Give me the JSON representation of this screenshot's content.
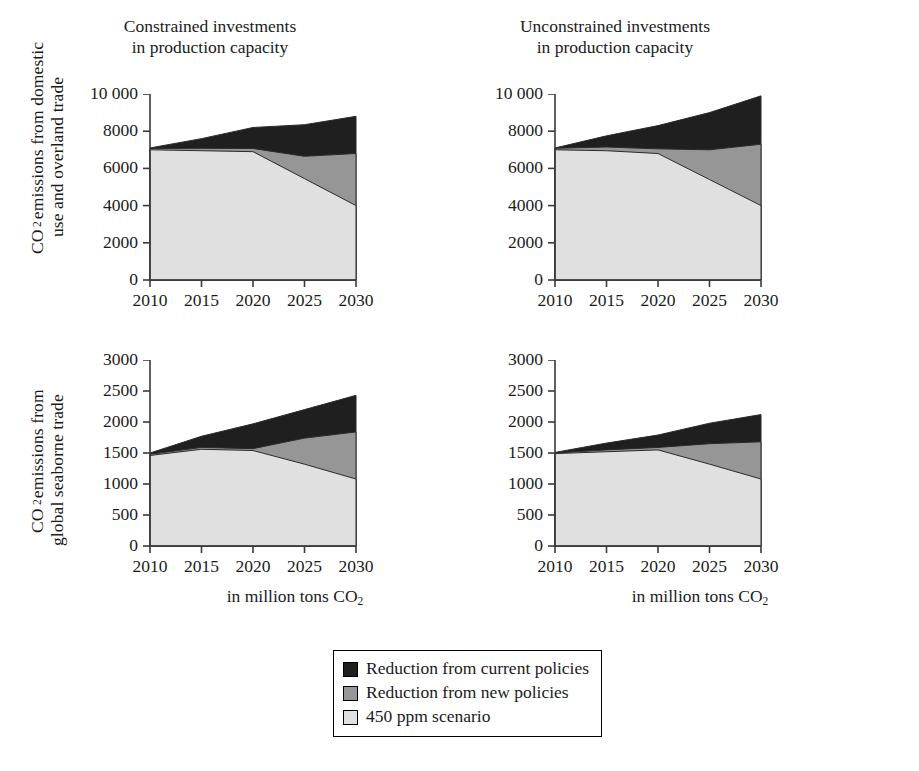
{
  "figure": {
    "row_captions": [
      "CO₂ emissions from domestic\nuse and overland trade",
      "CO₂ emissions from\nglobal seaborne trade"
    ],
    "x_caption": "in million tons CO₂"
  },
  "legend": {
    "items": [
      {
        "label": "Reduction from current policies",
        "color": "#1f1f1f"
      },
      {
        "label": "Reduction from new policies",
        "color": "#969696"
      },
      {
        "label": "450 ppm scenario",
        "color": "#e0e0e0"
      }
    ]
  },
  "colors": {
    "current_policies": "#1f1f1f",
    "new_policies": "#969696",
    "ppm450": "#e0e0e0",
    "axis": "#3a3a3a",
    "outline": "#2b2b2b",
    "text": "#1a1a1a",
    "background": "#ffffff"
  },
  "chart_data": [
    {
      "id": "top-left",
      "type": "area",
      "stacked": true,
      "title": "Constrained investments\nin production capacity",
      "xlabel": "in million tons CO₂",
      "ylabel": "CO₂ emissions from domestic use and overland trade",
      "x": [
        2010,
        2015,
        2020,
        2025,
        2030
      ],
      "xlim": [
        2010,
        2030
      ],
      "xticks": [
        2010,
        2015,
        2020,
        2025,
        2030
      ],
      "xticklabels": [
        "2010",
        "2015",
        "2020",
        "2025",
        "2030"
      ],
      "ylim": [
        0,
        10000
      ],
      "yticks": [
        0,
        2000,
        4000,
        6000,
        8000,
        10000
      ],
      "yticklabels": [
        "0",
        "2000",
        "4000",
        "6000",
        "8000",
        "10 000"
      ],
      "grid": false,
      "legend_position": "below-figure",
      "series": [
        {
          "name": "450 ppm scenario",
          "values": [
            7000,
            6950,
            6900,
            5450,
            4000
          ]
        },
        {
          "name": "Reduction from new policies",
          "values": [
            70,
            130,
            170,
            1200,
            2800
          ]
        },
        {
          "name": "Reduction from current policies",
          "values": [
            30,
            520,
            1130,
            1700,
            2000
          ]
        }
      ],
      "cumulative_tops": [
        {
          "name": "450 ppm scenario",
          "values": [
            7000,
            6950,
            6900,
            5450,
            4000
          ]
        },
        {
          "name": "Reduction from new policies",
          "values": [
            7070,
            7080,
            7070,
            6650,
            6800
          ]
        },
        {
          "name": "Reduction from current policies",
          "values": [
            7100,
            7600,
            8200,
            8350,
            8800
          ]
        }
      ]
    },
    {
      "id": "top-right",
      "type": "area",
      "stacked": true,
      "title": "Unconstrained investments\nin production capacity",
      "xlabel": "in million tons CO₂",
      "ylabel": "CO₂ emissions from domestic use and overland trade",
      "x": [
        2010,
        2015,
        2020,
        2025,
        2030
      ],
      "xlim": [
        2010,
        2030
      ],
      "xticks": [
        2010,
        2015,
        2020,
        2025,
        2030
      ],
      "xticklabels": [
        "2010",
        "2015",
        "2020",
        "2025",
        "2030"
      ],
      "ylim": [
        0,
        10000
      ],
      "yticks": [
        0,
        2000,
        4000,
        6000,
        8000,
        10000
      ],
      "yticklabels": [
        "0",
        "2000",
        "4000",
        "6000",
        "8000",
        "10 000"
      ],
      "grid": false,
      "legend_position": "below-figure",
      "series": [
        {
          "name": "450 ppm scenario",
          "values": [
            7000,
            6950,
            6800,
            5400,
            4000
          ]
        },
        {
          "name": "Reduction from new policies",
          "values": [
            80,
            200,
            250,
            1600,
            3300
          ]
        },
        {
          "name": "Reduction from current policies",
          "values": [
            20,
            600,
            1250,
            2000,
            2600
          ]
        }
      ],
      "cumulative_tops": [
        {
          "name": "450 ppm scenario",
          "values": [
            7000,
            6950,
            6800,
            5400,
            4000
          ]
        },
        {
          "name": "Reduction from new policies",
          "values": [
            7080,
            7150,
            7050,
            7000,
            7300
          ]
        },
        {
          "name": "Reduction from current policies",
          "values": [
            7100,
            7750,
            8300,
            9000,
            9900
          ]
        }
      ]
    },
    {
      "id": "bottom-left",
      "type": "area",
      "stacked": true,
      "title": "",
      "xlabel": "in million tons CO₂",
      "ylabel": "CO₂ emissions from global seaborne trade",
      "x": [
        2010,
        2015,
        2020,
        2025,
        2030
      ],
      "xlim": [
        2010,
        2030
      ],
      "xticks": [
        2010,
        2015,
        2020,
        2025,
        2030
      ],
      "xticklabels": [
        "2010",
        "2015",
        "2020",
        "2025",
        "2030"
      ],
      "ylim": [
        0,
        3000
      ],
      "yticks": [
        0,
        500,
        1000,
        1500,
        2000,
        2500,
        3000
      ],
      "yticklabels": [
        "0",
        "500",
        "1000",
        "1500",
        "2000",
        "2500",
        "3000"
      ],
      "grid": false,
      "legend_position": "below-figure",
      "series": [
        {
          "name": "450 ppm scenario",
          "values": [
            1460,
            1560,
            1540,
            1320,
            1080
          ]
        },
        {
          "name": "Reduction from new policies",
          "values": [
            20,
            30,
            30,
            420,
            760
          ]
        },
        {
          "name": "Reduction from current policies",
          "values": [
            20,
            180,
            400,
            460,
            590
          ]
        }
      ],
      "cumulative_tops": [
        {
          "name": "450 ppm scenario",
          "values": [
            1460,
            1560,
            1540,
            1320,
            1080
          ]
        },
        {
          "name": "Reduction from new policies",
          "values": [
            1480,
            1590,
            1570,
            1740,
            1840
          ]
        },
        {
          "name": "Reduction from current policies",
          "values": [
            1500,
            1770,
            1970,
            2200,
            2430
          ]
        }
      ]
    },
    {
      "id": "bottom-right",
      "type": "area",
      "stacked": true,
      "title": "",
      "xlabel": "in million tons CO₂",
      "ylabel": "CO₂ emissions from global seaborne trade",
      "x": [
        2010,
        2015,
        2020,
        2025,
        2030
      ],
      "xlim": [
        2010,
        2030
      ],
      "xticks": [
        2010,
        2015,
        2020,
        2025,
        2030
      ],
      "xticklabels": [
        "2010",
        "2015",
        "2020",
        "2025",
        "2030"
      ],
      "ylim": [
        0,
        3000
      ],
      "yticks": [
        0,
        500,
        1000,
        1500,
        2000,
        2500,
        3000
      ],
      "yticklabels": [
        "0",
        "500",
        "1000",
        "1500",
        "2000",
        "2500",
        "3000"
      ],
      "grid": false,
      "legend_position": "below-figure",
      "series": [
        {
          "name": "450 ppm scenario",
          "values": [
            1490,
            1520,
            1550,
            1320,
            1080
          ]
        },
        {
          "name": "Reduction from new policies",
          "values": [
            10,
            30,
            40,
            330,
            600
          ]
        },
        {
          "name": "Reduction from current policies",
          "values": [
            10,
            110,
            200,
            330,
            440
          ]
        }
      ],
      "cumulative_tops": [
        {
          "name": "450 ppm scenario",
          "values": [
            1490,
            1520,
            1550,
            1320,
            1080
          ]
        },
        {
          "name": "Reduction from new policies",
          "values": [
            1500,
            1550,
            1590,
            1650,
            1680
          ]
        },
        {
          "name": "Reduction from current policies",
          "values": [
            1510,
            1660,
            1790,
            1980,
            2120
          ]
        }
      ]
    }
  ]
}
